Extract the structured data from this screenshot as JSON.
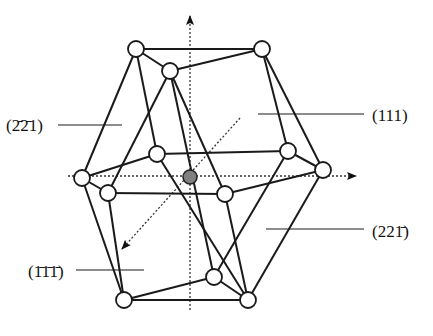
{
  "diagram": {
    "title": "",
    "colors": {
      "line": "#1a1a1a",
      "node_fill": "#ffffff",
      "center_fill": "#808080",
      "axis": "#333333"
    },
    "labels": [
      {
        "id": "lbl-m221",
        "text": "(2̄2̄1)",
        "x": 6,
        "y": 131,
        "leader": [
          58,
          125,
          122,
          125
        ]
      },
      {
        "id": "lbl-111",
        "text": "(111)",
        "x": 372,
        "y": 121,
        "leader": [
          258,
          114,
          364,
          114
        ]
      },
      {
        "id": "lbl-221m",
        "text": "(221̄)",
        "x": 372,
        "y": 237,
        "leader": [
          266,
          229,
          364,
          229
        ]
      },
      {
        "id": "lbl-m111",
        "text": "(1̄1̄1̄)",
        "x": 28,
        "y": 277,
        "leader": [
          76,
          270,
          144,
          270
        ]
      }
    ],
    "vertices": [
      {
        "id": "A",
        "x": 136,
        "y": 49
      },
      {
        "id": "B",
        "x": 262,
        "y": 49
      },
      {
        "id": "C",
        "x": 170,
        "y": 71
      },
      {
        "id": "D",
        "x": 157,
        "y": 154
      },
      {
        "id": "E",
        "x": 288,
        "y": 151
      },
      {
        "id": "F",
        "x": 82,
        "y": 178
      },
      {
        "id": "G",
        "x": 323,
        "y": 170
      },
      {
        "id": "H",
        "x": 108,
        "y": 193
      },
      {
        "id": "I",
        "x": 225,
        "y": 194
      },
      {
        "id": "J",
        "x": 214,
        "y": 277
      },
      {
        "id": "K",
        "x": 124,
        "y": 300
      },
      {
        "id": "L",
        "x": 248,
        "y": 300
      }
    ],
    "center": {
      "x": 190,
      "y": 177
    },
    "edges": [
      [
        "A",
        "B"
      ],
      [
        "A",
        "C"
      ],
      [
        "C",
        "B"
      ],
      [
        "A",
        "F"
      ],
      [
        "A",
        "D"
      ],
      [
        "C",
        "H"
      ],
      [
        "C",
        "I"
      ],
      [
        "B",
        "E"
      ],
      [
        "B",
        "G"
      ],
      [
        "D",
        "E"
      ],
      [
        "F",
        "D"
      ],
      [
        "E",
        "G"
      ],
      [
        "E",
        "J"
      ],
      [
        "F",
        "H"
      ],
      [
        "H",
        "I"
      ],
      [
        "I",
        "G"
      ],
      [
        "F",
        "K"
      ],
      [
        "H",
        "K"
      ],
      [
        "D",
        "L"
      ],
      [
        "I",
        "L"
      ],
      [
        "G",
        "L"
      ],
      [
        "J",
        "K"
      ],
      [
        "J",
        "L"
      ],
      [
        "K",
        "L"
      ],
      [
        "C",
        "J"
      ]
    ],
    "axes": [
      {
        "id": "axis-vertical",
        "from": [
          190,
          310
        ],
        "to": [
          190,
          16
        ]
      },
      {
        "id": "axis-horizontal",
        "from": [
          68,
          176
        ],
        "to": [
          356,
          176
        ]
      },
      {
        "id": "axis-diagonal",
        "from": [
          240,
          118
        ],
        "to": [
          122,
          249
        ]
      }
    ]
  }
}
